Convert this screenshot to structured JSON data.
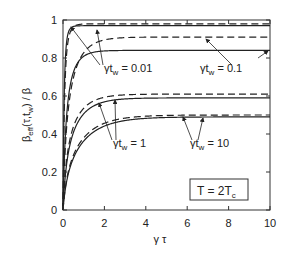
{
  "chart_data": {
    "type": "line",
    "title": "",
    "xlabel": "γτ",
    "ylabel": "β_eff(τ,t_w) / β",
    "xlim": [
      0,
      10
    ],
    "ylim": [
      0,
      1
    ],
    "x_ticks": [
      "0",
      "2",
      "4",
      "6",
      "8",
      "10"
    ],
    "y_ticks": [
      "0",
      "0.2",
      "0.4",
      "0.6",
      "0.8",
      "1"
    ],
    "grid": false,
    "annotation_box": "T = 2T_c",
    "series": [
      {
        "name": "γt_w = 0.01 (solid)",
        "style": "solid",
        "plateau": 0.97,
        "rate": 6.0
      },
      {
        "name": "γt_w = 0.01 (dashed)",
        "style": "dashed",
        "plateau": 0.98,
        "rate": 4.5
      },
      {
        "name": "γt_w = 0.1 (solid)",
        "style": "solid",
        "plateau": 0.84,
        "rate": 2.2
      },
      {
        "name": "γt_w = 0.1 (dashed)",
        "style": "dashed",
        "plateau": 0.91,
        "rate": 1.6
      },
      {
        "name": "γt_w = 1 (solid)",
        "style": "solid",
        "plateau": 0.59,
        "rate": 1.3
      },
      {
        "name": "γt_w = 1 (dashed)",
        "style": "dashed",
        "plateau": 0.61,
        "rate": 1.4
      },
      {
        "name": "γt_w = 10 (solid)",
        "style": "solid",
        "plateau": 0.49,
        "rate": 0.9
      },
      {
        "name": "γt_w = 10 (dashed)",
        "style": "dashed",
        "plateau": 0.5,
        "rate": 0.95
      }
    ],
    "labels": [
      {
        "text_main": "γt",
        "text_sub": "w",
        "text_rest": " = 0.01",
        "x": 104,
        "y": 72
      },
      {
        "text_main": "γt",
        "text_sub": "w",
        "text_rest": " = 0.1",
        "x": 200,
        "y": 72
      },
      {
        "text_main": "γt",
        "text_sub": "w",
        "text_rest": " = 1",
        "x": 113,
        "y": 147
      },
      {
        "text_main": "γt",
        "text_sub": "w",
        "text_rest": " = 10",
        "x": 190,
        "y": 147
      }
    ]
  },
  "labels": {
    "xlabel": "γ τ",
    "ylabel_main": "β",
    "ylabel_sub": "eff",
    "ylabel_rest": "(τ,t",
    "ylabel_sub2": "w",
    "ylabel_end": ") / β",
    "box_main": "T = 2T",
    "box_sub": "c"
  }
}
